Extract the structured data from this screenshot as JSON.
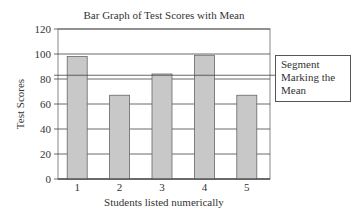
{
  "chart_data": {
    "type": "bar",
    "title": "Bar Graph of Test Scores with Mean",
    "xlabel": "Students listed numerically",
    "ylabel": "Test Scores",
    "categories": [
      "1",
      "2",
      "3",
      "4",
      "5"
    ],
    "values": [
      98,
      67,
      84,
      99,
      67
    ],
    "mean": 83,
    "ylim": [
      0,
      120
    ],
    "yticks": [
      0,
      20,
      40,
      60,
      80,
      100,
      120
    ],
    "grid": true,
    "bar_color": "#c8c8c8",
    "legend": {
      "text": "Segment Marking the Mean",
      "position": "right"
    }
  },
  "legend_lines": [
    "Segment",
    "Marking the",
    "Mean"
  ]
}
